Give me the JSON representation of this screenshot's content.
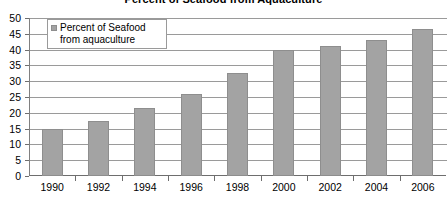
{
  "chart_data": {
    "type": "bar",
    "title": "Percent of Seafood from Aquaculture",
    "xlabel": "",
    "ylabel": "",
    "categories": [
      "1990",
      "1992",
      "1994",
      "1996",
      "1998",
      "2000",
      "2002",
      "2004",
      "2006"
    ],
    "series": [
      {
        "name": "Percent of Seafood from aquaculture",
        "values": [
          15,
          17.5,
          21.5,
          26,
          32.5,
          40,
          41,
          43,
          46.5
        ]
      }
    ],
    "ylim": [
      0,
      50
    ],
    "ytick_labels": [
      "0",
      "5",
      "10",
      "15",
      "20",
      "25",
      "30",
      "35",
      "40",
      "45",
      "50"
    ],
    "ytick_values": [
      0,
      5,
      10,
      15,
      20,
      25,
      30,
      35,
      40,
      45,
      50
    ],
    "grid": "horizontal",
    "legend_position": "top-left",
    "bar_color": "#a3a3a3",
    "gridline_color": "#9a9a9a",
    "axis_color": "#6e6e6e"
  },
  "legend": {
    "swatch_icon": "legend-swatch-icon",
    "label": "Percent of Seafood from aquaculture"
  }
}
